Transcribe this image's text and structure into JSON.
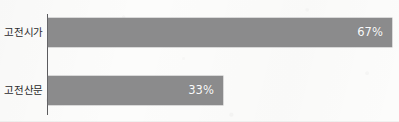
{
  "chart_data": {
    "type": "bar",
    "orientation": "horizontal",
    "title": "",
    "subtitle": "",
    "xlabel": "",
    "ylabel": "",
    "categories": [
      "고전시가",
      "고전산문"
    ],
    "values": [
      67,
      33
    ],
    "value_labels": [
      "67%",
      "33%"
    ],
    "unit": "%",
    "xlim": [
      0,
      78
    ],
    "grid": false,
    "legend": false,
    "legend_position": "none",
    "series": [
      {
        "name": "",
        "values": [
          67,
          33
        ]
      }
    ],
    "annotations": []
  },
  "style": {
    "bar_color": "#8b8b8c",
    "axis_color": "#5b5b5e",
    "label_color": "#2b2b2d",
    "value_text_color": "#fbfbfb",
    "background_color": "#fcfcfb"
  },
  "bars": [
    {
      "category": "고전시가",
      "value": 67,
      "value_label": "67%",
      "bar_px_width": 344,
      "row_class": "row-0"
    },
    {
      "category": "고전산문",
      "value": 33,
      "value_label": "33%",
      "bar_px_width": 175,
      "row_class": "row-1"
    }
  ]
}
